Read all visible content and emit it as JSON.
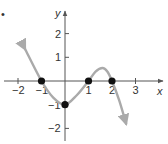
{
  "chart_data": {
    "type": "line",
    "title": "",
    "xlabel": "x",
    "ylabel": "y",
    "xlim": [
      -2.5,
      3.5
    ],
    "ylim": [
      -2.5,
      3
    ],
    "grid": false,
    "legend": null,
    "x_ticks": [
      "-2",
      "-1",
      "1",
      "2",
      "3"
    ],
    "y_ticks": [
      "2",
      "1",
      "-1",
      "-2"
    ],
    "series": [
      {
        "name": "f(x)",
        "color": "#aaaaaa",
        "x": [
          -1.7,
          -1,
          -0.5,
          0,
          0.5,
          1,
          1.3,
          1.6,
          1.8,
          2,
          2.3,
          2.6
        ],
        "y": [
          1.35,
          0,
          -0.7,
          -1,
          -0.6,
          0,
          0.4,
          0.55,
          0.4,
          0,
          -0.8,
          -1.8
        ],
        "arrows": "both"
      }
    ],
    "marked_points": [
      {
        "x": -1,
        "y": 0
      },
      {
        "x": 0,
        "y": -1
      },
      {
        "x": 1,
        "y": 0
      },
      {
        "x": 2,
        "y": 0
      }
    ]
  },
  "labels": {
    "bullet": "•",
    "x_axis": "x",
    "y_axis": "y",
    "ticks_x": [
      {
        "v": -2,
        "t": "−2"
      },
      {
        "v": -1,
        "t": "−1"
      },
      {
        "v": 1,
        "t": "1"
      },
      {
        "v": 2,
        "t": "2"
      },
      {
        "v": 3,
        "t": "3"
      }
    ],
    "ticks_y": [
      {
        "v": 2,
        "t": "2"
      },
      {
        "v": 1,
        "t": "1"
      },
      {
        "v": -1,
        "t": "−1"
      },
      {
        "v": -2,
        "t": "−2"
      }
    ]
  }
}
